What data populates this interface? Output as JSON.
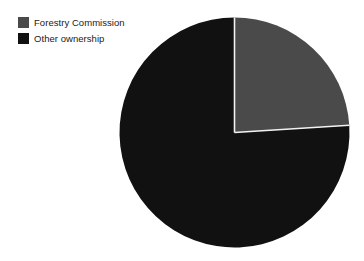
{
  "chart_data": {
    "type": "pie",
    "title": "",
    "subtitle": "",
    "xlabel": "",
    "ylabel": "",
    "grid": false,
    "legend_position": "top-left",
    "start_angle_deg": 0,
    "direction": "clockwise",
    "categories": [
      "Forestry Commission",
      "Other ownership"
    ],
    "values": [
      24,
      76
    ],
    "slices": [
      {
        "label": "Forestry Commission",
        "value": 24,
        "percent": 24,
        "color": "#4a4a4a",
        "start_angle_deg": 0,
        "end_angle_deg": 86.4
      },
      {
        "label": "Other ownership",
        "value": 76,
        "percent": 76,
        "color": "#111111",
        "start_angle_deg": 86.4,
        "end_angle_deg": 360
      }
    ],
    "annotations": []
  },
  "legend": {
    "items": [
      {
        "label": "Forestry Commission",
        "color": "#4a4a4a",
        "swatch_name": "legend-swatch-forestry-commission"
      },
      {
        "label": "Other ownership",
        "color": "#111111",
        "swatch_name": "legend-swatch-other-ownership"
      }
    ]
  },
  "geometry": {
    "center_x": 234.5,
    "center_y": 132.5,
    "radius": 115
  },
  "colors": {
    "background": "#ffffff",
    "slice_separator": "#f2f2f2",
    "text": "#1a1a1a"
  }
}
